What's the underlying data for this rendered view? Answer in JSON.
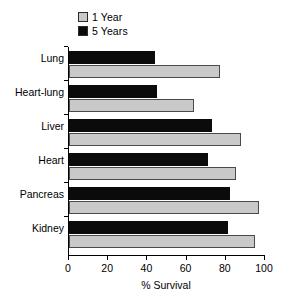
{
  "chart_data": {
    "type": "bar",
    "orientation": "horizontal",
    "title": "",
    "xlabel": "% Survival",
    "ylabel": "",
    "xlim": [
      0,
      100
    ],
    "xticks": [
      0,
      20,
      40,
      60,
      80,
      100
    ],
    "grid": false,
    "legend_position": "top-left",
    "categories": [
      "Lung",
      "Heart-lung",
      "Liver",
      "Heart",
      "Pancreas",
      "Kidney"
    ],
    "series": [
      {
        "name": "1 Year",
        "color": "#c9c9c9",
        "values": [
          77,
          64,
          88,
          85,
          97,
          95
        ]
      },
      {
        "name": "5 Years",
        "color": "#0b0b0b",
        "values": [
          44,
          45,
          73,
          71,
          82,
          81
        ]
      }
    ]
  },
  "legend": {
    "entries": [
      {
        "label": "1 Year",
        "swatch": "#c9c9c9"
      },
      {
        "label": "5 Years",
        "swatch": "#0b0b0b"
      }
    ]
  },
  "axis": {
    "x_title": "% Survival",
    "x_tick_labels": [
      "0",
      "20",
      "40",
      "60",
      "80",
      "100"
    ],
    "y_tick_labels": [
      "Lung",
      "Heart-lung",
      "Liver",
      "Heart",
      "Pancreas",
      "Kidney"
    ]
  }
}
